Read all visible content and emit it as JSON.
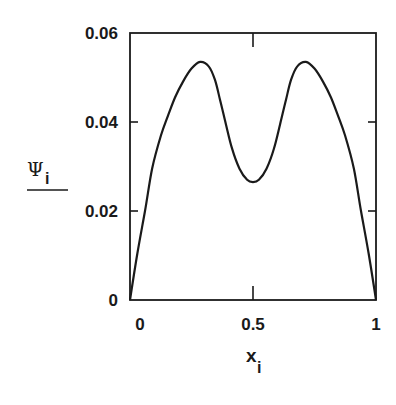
{
  "chart_data": {
    "type": "line",
    "title": "",
    "xlabel": "x",
    "xlabel_subscript": "i",
    "ylabel": "Ψ",
    "ylabel_subscript": "i",
    "xlim": [
      0,
      1
    ],
    "ylim": [
      0,
      0.06
    ],
    "grid": false,
    "legend": null,
    "x_ticks": [
      0,
      0.5,
      1
    ],
    "x_tick_labels": [
      "0",
      "0.5",
      "1"
    ],
    "y_ticks": [
      0,
      0.02,
      0.04,
      0.06
    ],
    "y_tick_labels": [
      "0",
      "0.02",
      "0.04",
      "0.06"
    ],
    "series": [
      {
        "name": "Psi_i",
        "x": [
          0,
          0.03,
          0.061,
          0.09,
          0.126,
          0.155,
          0.183,
          0.215,
          0.25,
          0.285,
          0.32,
          0.345,
          0.366,
          0.39,
          0.415,
          0.445,
          0.476,
          0.5,
          0.524,
          0.555,
          0.585,
          0.61,
          0.634,
          0.655,
          0.68,
          0.715,
          0.75,
          0.785,
          0.817,
          0.845,
          0.874,
          0.91,
          0.939,
          0.97,
          1.0
        ],
        "y": [
          0,
          0.0105,
          0.02,
          0.0295,
          0.037,
          0.0415,
          0.0455,
          0.049,
          0.052,
          0.0535,
          0.0525,
          0.0495,
          0.045,
          0.0395,
          0.034,
          0.0295,
          0.027,
          0.0265,
          0.027,
          0.0295,
          0.034,
          0.0395,
          0.045,
          0.0495,
          0.0525,
          0.0535,
          0.052,
          0.049,
          0.0455,
          0.0415,
          0.037,
          0.0295,
          0.02,
          0.0105,
          0
        ]
      }
    ],
    "colors": {
      "line": "#1a1a1a",
      "frame": "#1a1a1a",
      "background": "#ffffff"
    }
  }
}
